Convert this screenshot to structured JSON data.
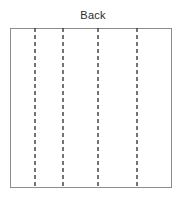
{
  "diagram": {
    "title": "Back",
    "type": "garment-pattern-panel",
    "background_color": "#ffffff",
    "panel": {
      "label": "Back",
      "shape": "rectangle",
      "x": 10,
      "y": 28,
      "width": 162,
      "height": 160,
      "border_color": "#8c8c8c",
      "border_width": 1,
      "fill_color": "#ffffff"
    },
    "fold_lines": {
      "count": 4,
      "style": "dashed",
      "color": "#3a3a3a",
      "stroke_width": 1.4,
      "dash_pattern": "4 3",
      "orientation": "vertical",
      "positions_px": [
        25,
        53,
        88,
        127
      ],
      "items": [
        {
          "name": "fold-line-1",
          "x": 25
        },
        {
          "name": "fold-line-2",
          "x": 53
        },
        {
          "name": "fold-line-3",
          "x": 88
        },
        {
          "name": "fold-line-4",
          "x": 127
        }
      ]
    }
  }
}
